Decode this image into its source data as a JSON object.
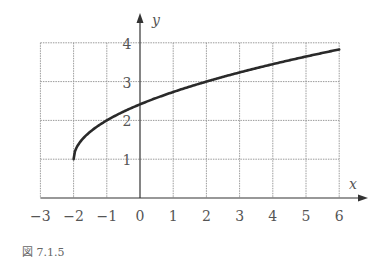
{
  "chart_data": {
    "type": "line",
    "title": "",
    "function": "y = sqrt(x + 2) + 1",
    "xlabel": "x",
    "ylabel": "y",
    "xlim": [
      -3,
      6
    ],
    "ylim": [
      0,
      4
    ],
    "grid": true,
    "x_ticks": [
      "−3",
      "−2",
      "−1",
      "0",
      "1",
      "2",
      "3",
      "4",
      "5",
      "6"
    ],
    "y_ticks": [
      "1",
      "2",
      "3",
      "4"
    ],
    "series": [
      {
        "name": "y = √(x+2) + 1",
        "x": [
          -2,
          -1.75,
          -1.5,
          -1,
          0,
          1,
          2,
          3,
          4,
          5,
          6
        ],
        "y": [
          1,
          1.5,
          1.71,
          2,
          2.41,
          2.73,
          3,
          3.24,
          3.45,
          3.65,
          3.83
        ]
      }
    ],
    "colors": {
      "curve": "#2a2a2a",
      "grid": "#9a9a9a",
      "axis": "#333333"
    }
  },
  "caption": "図 7.1.5",
  "axis_labels": {
    "x": "x",
    "y": "y"
  }
}
